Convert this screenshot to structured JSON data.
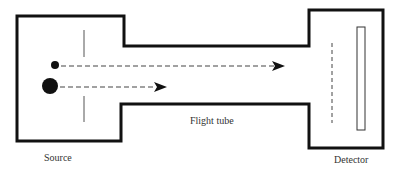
{
  "diagram": {
    "type": "time-of-flight mass spectrometer schematic",
    "labels": {
      "source": "Source",
      "flight_tube": "Flight tube",
      "detector": "Detector"
    },
    "components": [
      {
        "name": "source-chamber",
        "description": "Source region containing ions and accelerating grid"
      },
      {
        "name": "flight-tube",
        "description": "Field-free drift tube"
      },
      {
        "name": "detector-chamber",
        "description": "Detector region with grid and detector plate"
      }
    ],
    "ions": [
      {
        "name": "light-ion",
        "size": "small",
        "path": "long dashed arrow reaching end of flight tube"
      },
      {
        "name": "heavy-ion",
        "size": "large",
        "path": "short dashed arrow"
      }
    ],
    "colors": {
      "outline": "#111111",
      "dash": "#444444",
      "text": "#333333",
      "background": "#ffffff"
    }
  }
}
